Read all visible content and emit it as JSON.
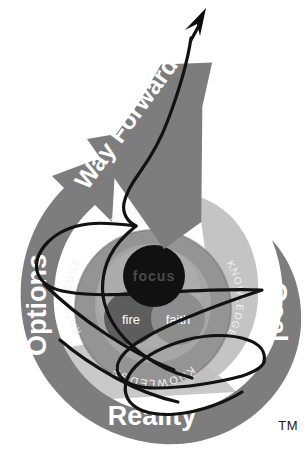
{
  "diagram": {
    "title": "Way Forward",
    "trademark": "TM",
    "arrow_label": "Way Forward",
    "outer_labels": {
      "left": "Options",
      "right": "Goal",
      "bottom": "Reality"
    },
    "ring_labels": {
      "top": "KNOWLEDGE",
      "left": "KNOWLEDGE",
      "right": "KNOWLEDGE",
      "bottom": "KNOWLEDGE"
    },
    "core_label": "focus",
    "inner_labels": {
      "left": "fire",
      "right": "faith"
    },
    "colors": {
      "background": "#ffffff",
      "outer_ring": "#808080",
      "petal_light": "#bdbdbd",
      "petal_light_2": "#c9c9c9",
      "knowledge_ring": "#9a9a9a",
      "knowledge_ring_inner": "#8e8e8e",
      "inner_disc": "#a8a8a8",
      "inner_disc_2": "#9e9e9e",
      "core": "#141414",
      "fire_circle": "#5f5f5f",
      "faith_circle": "#8a8a8a",
      "arrow": "#7a7a7a",
      "scribble": "#111111",
      "label_text": "#ffffff",
      "tm_text": "#1a1a1a"
    }
  }
}
